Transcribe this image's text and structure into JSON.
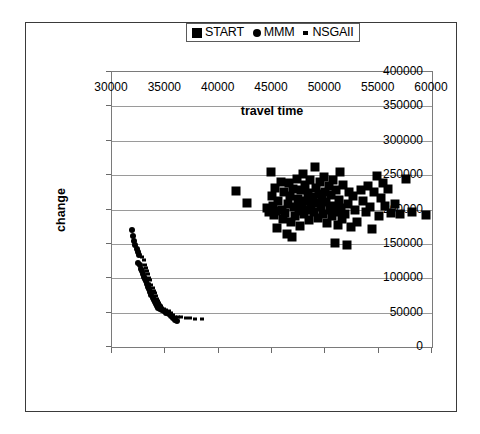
{
  "chart_data": {
    "type": "scatter",
    "title": "",
    "xlabel": "travel time",
    "ylabel": "change",
    "xlim": [
      30000,
      60000
    ],
    "ylim": [
      0,
      400000
    ],
    "xticks": [
      30000,
      35000,
      40000,
      45000,
      50000,
      55000,
      60000
    ],
    "yticks": [
      0,
      50000,
      100000,
      150000,
      200000,
      250000,
      300000,
      350000,
      400000
    ],
    "grid": "horizontal",
    "legend_position": "top-center",
    "series": [
      {
        "name": "START",
        "marker": "square",
        "color": "#000000",
        "points": [
          [
            41600,
            227000
          ],
          [
            42700,
            210000
          ],
          [
            44500,
            202000
          ],
          [
            44700,
            196000
          ],
          [
            44900,
            255000
          ],
          [
            45000,
            220000
          ],
          [
            45100,
            205000
          ],
          [
            45200,
            192000
          ],
          [
            45300,
            232000
          ],
          [
            45400,
            198000
          ],
          [
            45500,
            173000
          ],
          [
            45600,
            212000
          ],
          [
            45800,
            240000
          ],
          [
            45900,
            200000
          ],
          [
            46000,
            186000
          ],
          [
            46100,
            225000
          ],
          [
            46200,
            195000
          ],
          [
            46400,
            165000
          ],
          [
            46500,
            208000
          ],
          [
            46600,
            238000
          ],
          [
            46700,
            219000
          ],
          [
            46800,
            182000
          ],
          [
            46900,
            160000
          ],
          [
            47000,
            230000
          ],
          [
            47100,
            204000
          ],
          [
            47200,
            190000
          ],
          [
            47300,
            245000
          ],
          [
            47400,
            215000
          ],
          [
            47500,
            198000
          ],
          [
            47600,
            176000
          ],
          [
            47700,
            228000
          ],
          [
            47800,
            207000
          ],
          [
            47900,
            252000
          ],
          [
            48000,
            193000
          ],
          [
            48100,
            235000
          ],
          [
            48200,
            213000
          ],
          [
            48300,
            199000
          ],
          [
            48400,
            224000
          ],
          [
            48500,
            185000
          ],
          [
            48600,
            243000
          ],
          [
            48700,
            206000
          ],
          [
            48800,
            218000
          ],
          [
            48900,
            196000
          ],
          [
            49000,
            262000
          ],
          [
            49100,
            231000
          ],
          [
            49200,
            209000
          ],
          [
            49300,
            188000
          ],
          [
            49400,
            222000
          ],
          [
            49500,
            240000
          ],
          [
            49600,
            203000
          ],
          [
            49700,
            216000
          ],
          [
            49800,
            194000
          ],
          [
            49900,
            248000
          ],
          [
            50000,
            226000
          ],
          [
            50100,
            211000
          ],
          [
            50200,
            180000
          ],
          [
            50300,
            234000
          ],
          [
            50400,
            200000
          ],
          [
            50500,
            221000
          ],
          [
            50600,
            190000
          ],
          [
            50700,
            243000
          ],
          [
            50800,
            205000
          ],
          [
            50900,
            152000
          ],
          [
            51000,
            229000
          ],
          [
            51100,
            197000
          ],
          [
            51200,
            178000
          ],
          [
            51300,
            214000
          ],
          [
            51400,
            255000
          ],
          [
            51500,
            202000
          ],
          [
            51600,
            186000
          ],
          [
            51700,
            236000
          ],
          [
            51800,
            193000
          ],
          [
            52000,
            148000
          ],
          [
            52100,
            208000
          ],
          [
            52200,
            225000
          ],
          [
            52400,
            175000
          ],
          [
            52600,
            219000
          ],
          [
            52800,
            200000
          ],
          [
            53000,
            182000
          ],
          [
            53300,
            229000
          ],
          [
            53500,
            212000
          ],
          [
            53800,
            196000
          ],
          [
            54000,
            234000
          ],
          [
            54200,
            203000
          ],
          [
            54400,
            172000
          ],
          [
            54600,
            226000
          ],
          [
            54800,
            249000
          ],
          [
            55000,
            191000
          ],
          [
            55200,
            217000
          ],
          [
            55400,
            238000
          ],
          [
            55600,
            205000
          ],
          [
            55900,
            230000
          ],
          [
            56200,
            195000
          ],
          [
            56500,
            208000
          ],
          [
            57000,
            193000
          ],
          [
            57600,
            245000
          ],
          [
            58100,
            196000
          ],
          [
            59400,
            192000
          ]
        ]
      },
      {
        "name": "MMM",
        "marker": "circle",
        "color": "#000000",
        "points": [
          [
            31900,
            170000
          ],
          [
            32000,
            161000
          ],
          [
            32100,
            154000
          ],
          [
            32200,
            148000
          ],
          [
            32300,
            143000
          ],
          [
            32400,
            138000
          ],
          [
            32500,
            134000
          ],
          [
            32400,
            122000
          ],
          [
            32600,
            119000
          ],
          [
            32700,
            114000
          ],
          [
            32800,
            110000
          ],
          [
            32900,
            106000
          ],
          [
            33000,
            102000
          ],
          [
            33100,
            99000
          ],
          [
            33200,
            96000
          ],
          [
            33300,
            92000
          ],
          [
            33400,
            88000
          ],
          [
            33500,
            84000
          ],
          [
            33600,
            80000
          ],
          [
            33700,
            76000
          ],
          [
            33800,
            72000
          ],
          [
            33900,
            68000
          ],
          [
            34000,
            65000
          ],
          [
            34100,
            62000
          ],
          [
            34200,
            59000
          ],
          [
            34300,
            57000
          ],
          [
            34500,
            55000
          ],
          [
            34700,
            54000
          ],
          [
            34900,
            52000
          ],
          [
            35100,
            50000
          ],
          [
            35300,
            48000
          ],
          [
            35500,
            45000
          ],
          [
            35700,
            42000
          ],
          [
            35900,
            39000
          ],
          [
            36100,
            38000
          ]
        ]
      },
      {
        "name": "NSGAII",
        "marker": "small-square",
        "color": "#000000",
        "points": [
          [
            32800,
            131000
          ],
          [
            33000,
            126000
          ],
          [
            33100,
            120000
          ],
          [
            33200,
            115000
          ],
          [
            33300,
            110000
          ],
          [
            33400,
            106000
          ],
          [
            33500,
            101000
          ],
          [
            33600,
            97000
          ],
          [
            33500,
            92000
          ],
          [
            33700,
            90000
          ],
          [
            33800,
            86000
          ],
          [
            33900,
            82000
          ],
          [
            34000,
            78000
          ],
          [
            34100,
            74000
          ],
          [
            34200,
            70000
          ],
          [
            34300,
            67000
          ],
          [
            34400,
            64000
          ],
          [
            34500,
            61000
          ],
          [
            34600,
            59000
          ],
          [
            34700,
            57000
          ],
          [
            34900,
            56000
          ],
          [
            35100,
            54000
          ],
          [
            35300,
            52000
          ],
          [
            35500,
            49000
          ],
          [
            35700,
            46000
          ],
          [
            35900,
            44000
          ],
          [
            36200,
            43000
          ],
          [
            36500,
            43000
          ],
          [
            36900,
            42000
          ],
          [
            37300,
            42000
          ],
          [
            37800,
            41000
          ],
          [
            38400,
            41000
          ]
        ]
      }
    ]
  },
  "legend": {
    "entries": [
      {
        "label": "START",
        "marker": "square"
      },
      {
        "label": "MMM",
        "marker": "circle"
      },
      {
        "label": "NSGAII",
        "marker": "small-square"
      }
    ]
  }
}
